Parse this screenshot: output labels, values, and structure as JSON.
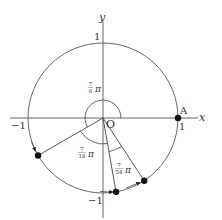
{
  "axes": {
    "x_label": "x",
    "y_label": "y",
    "origin_label": "O",
    "tick_pos_x": "1",
    "tick_neg_x": "−1",
    "tick_pos_y": "1",
    "tick_neg_y": "−1"
  },
  "points": {
    "A": {
      "label": "A",
      "angle_deg": 0
    },
    "P1": {
      "label": "",
      "angle_deg": 210
    },
    "P2": {
      "label": "",
      "angle_deg": 280
    },
    "P3": {
      "label": "",
      "angle_deg": 303.33
    }
  },
  "angles": [
    {
      "numerator": "7",
      "denominator": "6",
      "symbol": "π",
      "from_deg": 0,
      "to_deg": 210
    },
    {
      "numerator": "7",
      "denominator": "18",
      "symbol": "π",
      "from_deg": 210,
      "to_deg": 280
    },
    {
      "numerator": "7",
      "denominator": "54",
      "symbol": "π",
      "from_deg": 280,
      "to_deg": 303.33
    }
  ],
  "colors": {
    "line": "#444444",
    "point": "#111111"
  }
}
